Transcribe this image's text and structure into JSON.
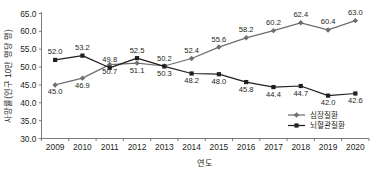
{
  "chart_data": {
    "type": "line",
    "title": "",
    "xlabel": "연도",
    "ylabel": "사망률(인구 10만 명당 명)",
    "categories": [
      "2009",
      "2010",
      "2011",
      "2012",
      "2013",
      "2014",
      "2015",
      "2016",
      "2017",
      "2018",
      "2019",
      "2020"
    ],
    "ylim": [
      30.0,
      65.0
    ],
    "ytick_labels": [
      "30.0",
      "35.0",
      "40.0",
      "45.0",
      "50.0",
      "55.0",
      "60.0",
      "65.0"
    ],
    "ytick_values": [
      30.0,
      35.0,
      40.0,
      45.0,
      50.0,
      55.0,
      60.0,
      65.0
    ],
    "grid": false,
    "legend_position": "bottom-right",
    "series": [
      {
        "name": "심장질환",
        "color": "#6d6e71",
        "marker": "diamond",
        "values": [
          45.0,
          46.9,
          50.7,
          51.1,
          50.3,
          52.4,
          55.6,
          58.2,
          60.2,
          62.4,
          60.4,
          63.0
        ],
        "labels": [
          "45.0",
          "46.9",
          "50.7",
          "51.1",
          "50.3",
          "52.4",
          "55.6",
          "58.2",
          "60.2",
          "62.4",
          "60.4",
          "63.0"
        ],
        "label_side": [
          "below",
          "below",
          "below",
          "below",
          "below",
          "above",
          "above",
          "above",
          "above",
          "above",
          "above",
          "above"
        ]
      },
      {
        "name": "뇌혈관질환",
        "color": "#231f20",
        "marker": "square",
        "values": [
          52.0,
          53.2,
          49.8,
          52.5,
          50.2,
          48.2,
          48.0,
          45.8,
          44.4,
          44.7,
          42.0,
          42.6
        ],
        "labels": [
          "52.0",
          "53.2",
          "49.8",
          "52.5",
          "50.2",
          "48.2",
          "48.0",
          "45.8",
          "44.4",
          "44.7",
          "42.0",
          "42.6"
        ],
        "label_side": [
          "above",
          "above",
          "above",
          "above",
          "above",
          "below",
          "below",
          "below",
          "below",
          "below",
          "below",
          "below"
        ]
      }
    ]
  },
  "legend": {
    "items": [
      {
        "label": "심장질환"
      },
      {
        "label": "뇌혈관질환"
      }
    ]
  },
  "axes": {
    "x_title": "연도",
    "y_title": "사망률(인구 10만 명당 명)"
  }
}
